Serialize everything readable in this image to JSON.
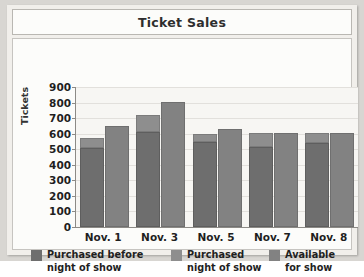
{
  "chart_data": {
    "type": "bar",
    "title": "Ticket Sales",
    "xlabel": "",
    "ylabel": "Tickets",
    "ylim": [
      0,
      900
    ],
    "ytick_step": 100,
    "yticks": [
      900,
      800,
      700,
      600,
      500,
      400,
      300,
      200,
      100,
      0
    ],
    "grid": true,
    "legend_position": "bottom",
    "stacking": "first bar of each group is a stack of 'Purchased before night of show' (bottom) and 'Purchased night of show' (top); second bar is 'Available for show'",
    "categories": [
      "Nov. 1",
      "Nov. 3",
      "Nov. 5",
      "Nov. 7",
      "Nov. 8"
    ],
    "series": [
      {
        "name": "Purchased before night of show",
        "color": "#6e6e6e",
        "values": [
          505,
          610,
          545,
          515,
          540
        ]
      },
      {
        "name": "Purchased night of show",
        "color": "#8e8e8e",
        "values": [
          65,
          110,
          50,
          90,
          65
        ]
      },
      {
        "name": "Available for show",
        "color": "#828282",
        "values": [
          650,
          805,
          630,
          605,
          605
        ]
      }
    ],
    "stack_totals": [
      570,
      720,
      595,
      605,
      605
    ]
  },
  "title": {
    "text": "Ticket Sales"
  },
  "axes": {
    "y_title": "Tickets",
    "y_ticks": [
      "900",
      "800",
      "700",
      "600",
      "500",
      "400",
      "300",
      "200",
      "100",
      "0"
    ],
    "x_ticks": [
      "Nov. 1",
      "Nov. 3",
      "Nov. 5",
      "Nov. 7",
      "Nov. 8"
    ]
  },
  "legend": {
    "items": [
      {
        "label": "Purchased before\nnight of show",
        "color": "#6e6e6e"
      },
      {
        "label": "Purchased\nnight of show",
        "color": "#8e8e8e"
      },
      {
        "label": "Available\nfor show",
        "color": "#828282"
      }
    ]
  }
}
